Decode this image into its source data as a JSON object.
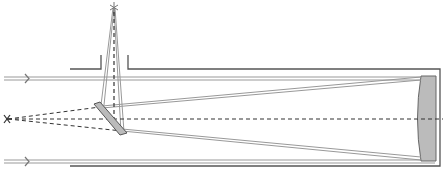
{
  "diagram": {
    "colors": {
      "background": "#ffffff",
      "tube": "#555555",
      "ray": "#888888",
      "axis": "#333333",
      "mirror_fill": "#bbbbbb",
      "mirror_stroke": "#666666"
    },
    "elements": [
      {
        "name": "incoming-ray-top",
        "label": ""
      },
      {
        "name": "incoming-ray-bottom",
        "label": ""
      },
      {
        "name": "primary-mirror",
        "label": ""
      },
      {
        "name": "secondary-mirror",
        "label": ""
      },
      {
        "name": "eyepiece-focus",
        "label": ""
      },
      {
        "name": "virtual-focus",
        "label": ""
      }
    ]
  }
}
